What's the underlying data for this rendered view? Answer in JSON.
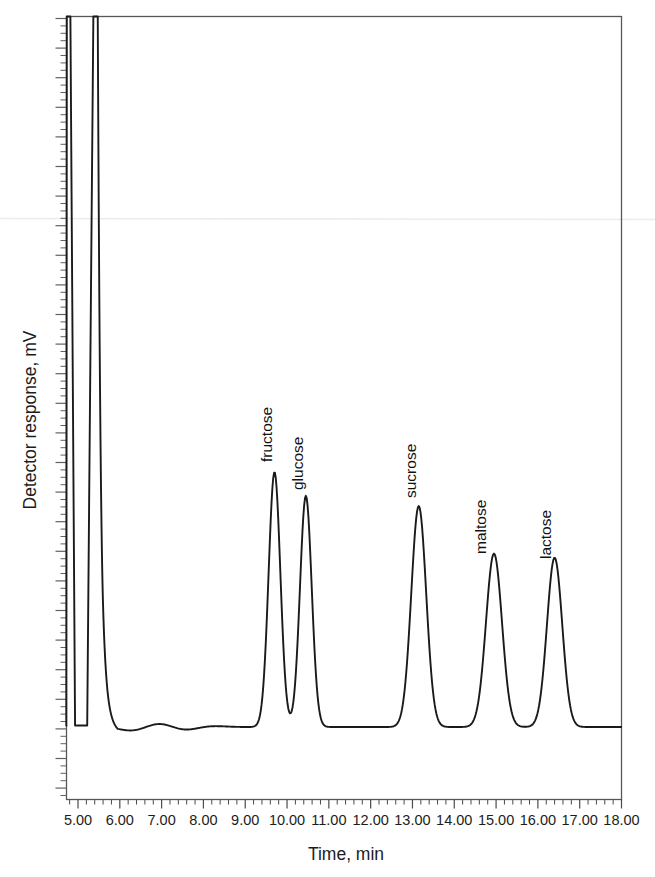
{
  "figure": {
    "background": "#ffffff",
    "trace_color": "#1a1a1a",
    "frame_color": "#555555",
    "artifact_line_color": "#ececed"
  },
  "chart_data": {
    "type": "line",
    "title": "",
    "subtitle": "",
    "xlabel": "Time, min",
    "ylabel": "Detector response, mV",
    "xlim": [
      4.5,
      18.0
    ],
    "ylim": [
      0,
      100
    ],
    "grid": false,
    "legend": false,
    "legend_position": "none",
    "xticks": [
      5.0,
      6.0,
      7.0,
      8.0,
      9.0,
      10.0,
      11.0,
      12.0,
      13.0,
      14.0,
      15.0,
      16.0,
      17.0,
      18.0
    ],
    "xtick_labels": [
      "5.00",
      "6.00",
      "7.00",
      "8.00",
      "9.00",
      "10.00",
      "11.00",
      "12.00",
      "13.00",
      "14.00",
      "15.00",
      "16.00",
      "17.00",
      "18.00"
    ],
    "xtick_minor_per_major": 5,
    "yticks_labeled": [],
    "baseline_response": 2.5,
    "series": [
      {
        "name": "sugar standards chromatogram",
        "peaks": [
          {
            "label": "fructose",
            "retention_time": 9.7,
            "height": 37.5,
            "width": 0.33,
            "labeled": true,
            "off_scale": false
          },
          {
            "label": "glucose",
            "retention_time": 10.45,
            "height": 34.0,
            "width": 0.33,
            "labeled": true,
            "off_scale": false
          },
          {
            "label": "sucrose",
            "retention_time": 13.15,
            "height": 32.5,
            "width": 0.42,
            "labeled": true,
            "off_scale": false
          },
          {
            "label": "maltose",
            "retention_time": 14.95,
            "height": 25.5,
            "width": 0.45,
            "labeled": true,
            "off_scale": false
          },
          {
            "label": "lactose",
            "retention_time": 16.4,
            "height": 24.9,
            "width": 0.43,
            "labeled": true,
            "off_scale": false
          },
          {
            "label": "",
            "retention_time": 4.78,
            "height": 120.0,
            "width": 0.06,
            "labeled": false,
            "off_scale": true
          },
          {
            "label": "",
            "retention_time": 5.42,
            "height": 120.0,
            "width": 0.09,
            "labeled": false,
            "off_scale": true
          }
        ],
        "baseline_wiggle": [
          {
            "time": 6.3,
            "offset": -0.55
          },
          {
            "time": 6.95,
            "offset": 0.55
          },
          {
            "time": 7.55,
            "offset": -0.45
          },
          {
            "time": 8.2,
            "offset": 0.15
          }
        ]
      }
    ]
  },
  "peak_labels": [
    {
      "text": "fructose",
      "x": 272,
      "y": 462
    },
    {
      "text": "glucose",
      "x": 303,
      "y": 490
    },
    {
      "text": "sucrose",
      "x": 416,
      "y": 498
    },
    {
      "text": "maltose",
      "x": 486,
      "y": 554
    },
    {
      "text": "lactose",
      "x": 551,
      "y": 559
    }
  ]
}
